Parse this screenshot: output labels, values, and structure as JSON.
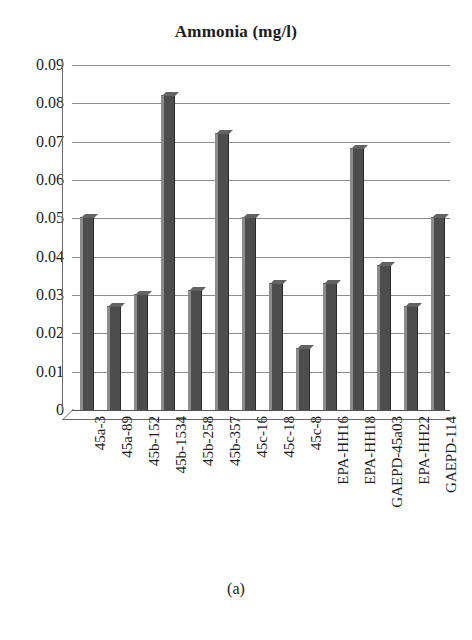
{
  "figure": {
    "caption": "(a)"
  },
  "chart_data": {
    "type": "bar",
    "title": "Ammonia (mg/l)",
    "xlabel": "",
    "ylabel": "",
    "ylim": [
      0,
      0.09
    ],
    "grid": true,
    "legend": "none",
    "ytick_labels": [
      "0.09",
      "0.08",
      "0.07",
      "0.06",
      "0.05",
      "0.04",
      "0.03",
      "0.02",
      "0.01",
      "0"
    ],
    "ytick_values": [
      0.09,
      0.08,
      0.07,
      0.06,
      0.05,
      0.04,
      0.03,
      0.02,
      0.01,
      0
    ],
    "categories": [
      "45a-3",
      "45a-89",
      "45b-152",
      "45b-1534",
      "45b-258",
      "45b-357",
      "45c-16",
      "45c-18",
      "45c-8",
      "EPA-HH16",
      "EPA-HH18",
      "GAEPD-45a03",
      "EPA-HH22",
      "GAEPD-114"
    ],
    "values": [
      0.05,
      0.027,
      0.03,
      0.082,
      0.031,
      0.072,
      0.05,
      0.033,
      0.016,
      0.033,
      0.068,
      0.0375,
      0.027,
      0.05
    ],
    "series": [
      {
        "name": "Ammonia (mg/l)",
        "color": "#4d4d4d",
        "values": [
          0.05,
          0.027,
          0.03,
          0.082,
          0.031,
          0.072,
          0.05,
          0.033,
          0.016,
          0.033,
          0.068,
          0.0375,
          0.027,
          0.05
        ]
      }
    ]
  }
}
